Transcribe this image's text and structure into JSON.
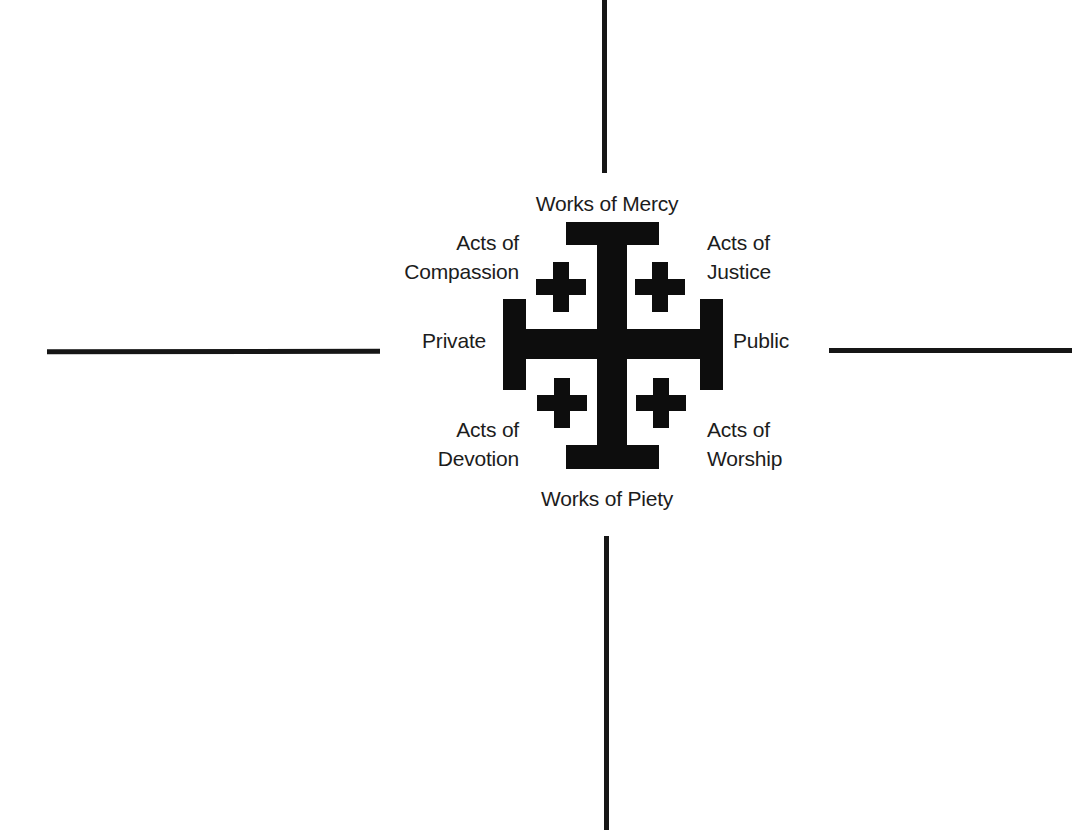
{
  "diagram": {
    "type": "quadrant-cross",
    "symbol": "jerusalem-cross",
    "colors": {
      "background": "#ffffff",
      "ink": "#0d0d0d",
      "text": "#1c1c1c"
    },
    "labels": {
      "top": "Works of Mercy",
      "bottom": "Works of Piety",
      "left": "Private",
      "right": "Public",
      "top_left": {
        "line1": "Acts of",
        "line2": "Compassion"
      },
      "top_right": {
        "line1": "Acts of",
        "line2": "Justice"
      },
      "bottom_left": {
        "line1": "Acts of",
        "line2": "Devotion"
      },
      "bottom_right": {
        "line1": "Acts of",
        "line2": "Worship"
      }
    },
    "axes": {
      "vertical_top": "axis-line",
      "vertical_bottom": "axis-line",
      "horizontal_left": "axis-line",
      "horizontal_right": "axis-line"
    }
  }
}
